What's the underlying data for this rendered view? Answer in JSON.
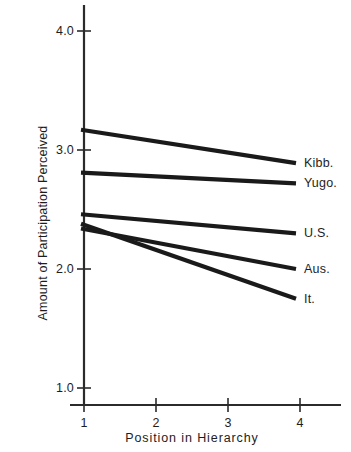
{
  "chart_data": {
    "type": "line",
    "title": "",
    "xlabel": "Position in Hierarchy",
    "ylabel": "Amount of Participation Perceived",
    "x": [
      1,
      4
    ],
    "xlim": [
      0.82,
      4.55
    ],
    "ylim": [
      0.82,
      4.25
    ],
    "xticks": [
      "1",
      "2",
      "3",
      "4"
    ],
    "xtick_values": [
      1,
      2,
      3,
      4
    ],
    "yticks": [
      "1.0",
      "2.0",
      "3.0",
      "4.0"
    ],
    "ytick_values": [
      1.0,
      2.0,
      3.0,
      4.0
    ],
    "grid": false,
    "legend_position": "right-inline-endpoint-labels",
    "line_color": "#1a1a1a",
    "axis_color": "#2b2b2b",
    "series": [
      {
        "name": "Kibb.",
        "values": [
          3.17,
          2.89
        ]
      },
      {
        "name": "Yugo.",
        "values": [
          2.81,
          2.72
        ]
      },
      {
        "name": "U.S.",
        "values": [
          2.46,
          2.3
        ]
      },
      {
        "name": "Aus.",
        "values": [
          2.34,
          2.0
        ]
      },
      {
        "name": "It.",
        "values": [
          2.38,
          1.75
        ]
      }
    ]
  }
}
